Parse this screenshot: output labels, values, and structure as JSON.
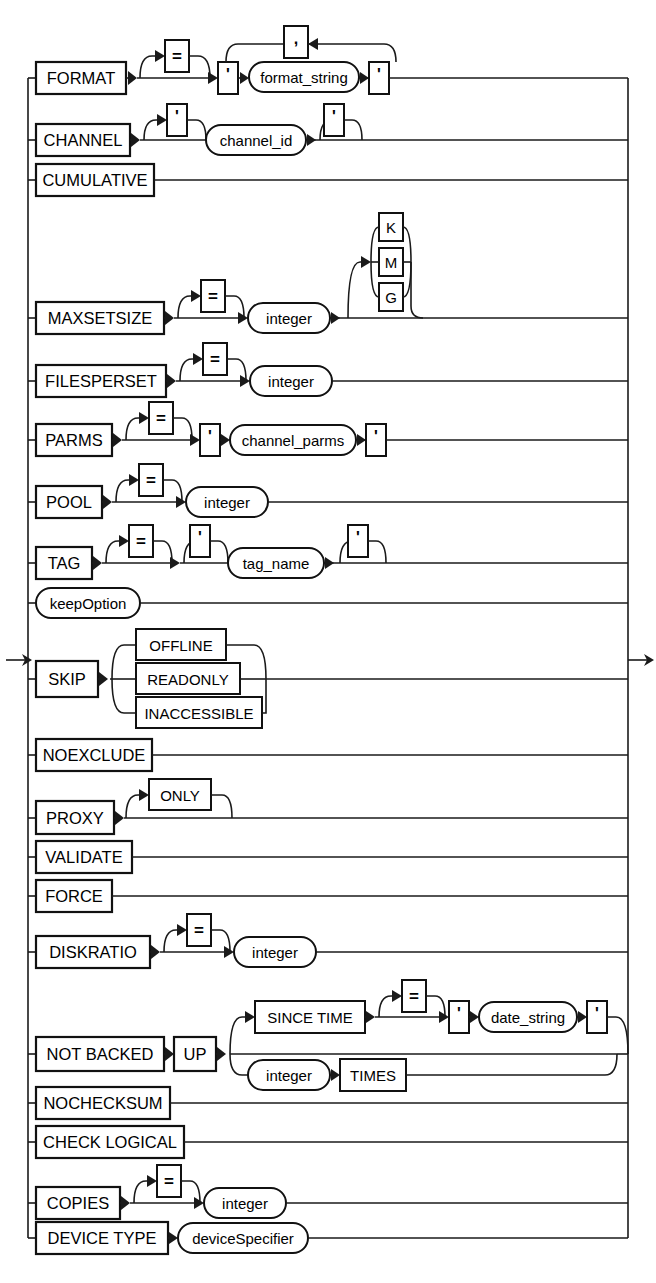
{
  "diagram": {
    "kind": "railroad-syntax-diagram",
    "entry_arrow": "entry-arrow",
    "exit_arrow": "exit-arrow",
    "colors": {
      "line": "#1a1a1a",
      "box_stroke": "#111111",
      "background": "#ffffff",
      "text": "#000000"
    },
    "rows": [
      {
        "id": "format",
        "keyword": "FORMAT",
        "optional_equals": "=",
        "quote": "'",
        "variable": "format_string",
        "repeat_separator": ",",
        "has_repeat_loop": true
      },
      {
        "id": "channel",
        "keyword": "CHANNEL",
        "quote_open": "'",
        "quote_close": "'",
        "variable": "channel_id"
      },
      {
        "id": "cumulative",
        "keyword": "CUMULATIVE"
      },
      {
        "id": "maxsetsize",
        "keyword": "MAXSETSIZE",
        "optional_equals": "=",
        "variable": "integer",
        "unit_choices": [
          "K",
          "M",
          "G"
        ]
      },
      {
        "id": "filesperset",
        "keyword": "FILESPERSET",
        "optional_equals": "=",
        "variable": "integer"
      },
      {
        "id": "parms",
        "keyword": "PARMS",
        "optional_equals": "=",
        "quote_open": "'",
        "quote_close": "'",
        "variable": "channel_parms"
      },
      {
        "id": "pool",
        "keyword": "POOL",
        "optional_equals": "=",
        "variable": "integer"
      },
      {
        "id": "tag",
        "keyword": "TAG",
        "optional_equals": "=",
        "quote_open": "'",
        "quote_close": "'",
        "variable": "tag_name"
      },
      {
        "id": "keepoption",
        "variable": "keepOption"
      },
      {
        "id": "skip",
        "keyword": "SKIP",
        "choices": [
          "OFFLINE",
          "READONLY",
          "INACCESSIBLE"
        ]
      },
      {
        "id": "noexclude",
        "keyword": "NOEXCLUDE"
      },
      {
        "id": "proxy",
        "keyword": "PROXY",
        "optional_keyword": "ONLY"
      },
      {
        "id": "validate",
        "keyword": "VALIDATE"
      },
      {
        "id": "force",
        "keyword": "FORCE"
      },
      {
        "id": "diskratio",
        "keyword": "DISKRATIO",
        "optional_equals": "=",
        "variable": "integer"
      },
      {
        "id": "not-backed-up",
        "keyword": "NOT BACKED",
        "keyword2": "UP",
        "branch_a": {
          "keyword": "SINCE TIME",
          "optional_equals": "=",
          "quote_open": "'",
          "quote_close": "'",
          "variable": "date_string"
        },
        "branch_b": {
          "variable": "integer",
          "keyword": "TIMES"
        }
      },
      {
        "id": "nochecksum",
        "keyword": "NOCHECKSUM"
      },
      {
        "id": "check-logical",
        "keyword": "CHECK LOGICAL"
      },
      {
        "id": "copies",
        "keyword": "COPIES",
        "optional_equals": "=",
        "variable": "integer"
      },
      {
        "id": "device-type",
        "keyword": "DEVICE TYPE",
        "variable": "deviceSpecifier"
      }
    ]
  }
}
